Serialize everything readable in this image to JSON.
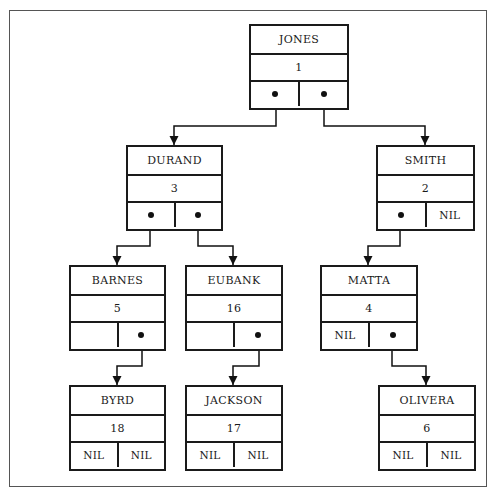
{
  "diagram": {
    "type": "binary-tree-linked-nodes",
    "nodes": {
      "jones": {
        "name": "JONES",
        "value": "1",
        "left": "pointer",
        "right": "pointer"
      },
      "durand": {
        "name": "DURAND",
        "value": "3",
        "left": "pointer",
        "right": "pointer"
      },
      "smith": {
        "name": "SMITH",
        "value": "2",
        "left": "pointer",
        "right": "NIL"
      },
      "barnes": {
        "name": "BARNES",
        "value": "5",
        "left": "",
        "right": "pointer"
      },
      "eubank": {
        "name": "EUBANK",
        "value": "16",
        "left": "",
        "right": "pointer"
      },
      "matta": {
        "name": "MATTA",
        "value": "4",
        "left": "NIL",
        "right": "pointer"
      },
      "byrd": {
        "name": "BYRD",
        "value": "18",
        "left": "NIL",
        "right": "NIL"
      },
      "jackson": {
        "name": "JACKSON",
        "value": "17",
        "left": "NIL",
        "right": "NIL"
      },
      "olivera": {
        "name": "OLIVERA",
        "value": "6",
        "left": "NIL",
        "right": "NIL"
      }
    },
    "edges": [
      {
        "from": "JONES",
        "side": "left",
        "to": "DURAND"
      },
      {
        "from": "JONES",
        "side": "right",
        "to": "SMITH"
      },
      {
        "from": "DURAND",
        "side": "left",
        "to": "BARNES"
      },
      {
        "from": "DURAND",
        "side": "right",
        "to": "EUBANK"
      },
      {
        "from": "SMITH",
        "side": "left",
        "to": "MATTA"
      },
      {
        "from": "BARNES",
        "side": "right",
        "to": "BYRD"
      },
      {
        "from": "EUBANK",
        "side": "right",
        "to": "JACKSON"
      },
      {
        "from": "MATTA",
        "side": "right",
        "to": "OLIVERA"
      }
    ]
  }
}
